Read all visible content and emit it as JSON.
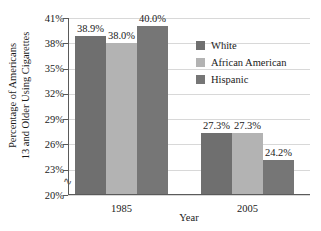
{
  "chart_data": {
    "type": "bar",
    "title": "",
    "xlabel": "Year",
    "ylabel": "Percentage of Americans 13 and Older Using Cigarettes",
    "ylabel_lines": [
      "Percentage of Americans",
      "13 and Older Using Cigarettes"
    ],
    "categories": [
      "1985",
      "2005"
    ],
    "series": [
      {
        "name": "White",
        "values": [
          38.9,
          27.3
        ],
        "labels": [
          "38.9%",
          "27.3%"
        ],
        "color": "#6f6f6f"
      },
      {
        "name": "African American",
        "values": [
          38.0,
          27.3
        ],
        "labels": [
          "38.0%",
          "27.3%"
        ],
        "color": "#b3b3b3"
      },
      {
        "name": "Hispanic",
        "values": [
          40.0,
          24.2
        ],
        "labels": [
          "40.0%",
          "24.2%"
        ],
        "color": "#767676"
      }
    ],
    "ylim": [
      20,
      41
    ],
    "ytick_labels": [
      "41%",
      "38%",
      "35%",
      "32%",
      "29%",
      "26%",
      "23%",
      "20%"
    ],
    "ytick_values": [
      41,
      38,
      35,
      32,
      29,
      26,
      23,
      20
    ],
    "grid": true,
    "axis_break": true,
    "axis_break_glyph": "∿",
    "legend_position": "inside-upper-right"
  },
  "legend": {
    "entries": [
      {
        "label": "White",
        "color": "#6f6f6f"
      },
      {
        "label": "African American",
        "color": "#b3b3b3"
      },
      {
        "label": "Hispanic",
        "color": "#767676"
      }
    ]
  }
}
